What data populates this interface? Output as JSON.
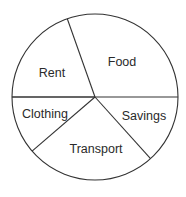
{
  "chart_data": {
    "type": "pie",
    "title": "",
    "categories": [
      "Savings",
      "Transport",
      "Clothing",
      "Rent",
      "Food"
    ],
    "values": [
      13.3,
      25.3,
      11.4,
      19.6,
      30.4
    ],
    "units": "percent (estimated from slice angles; no values printed on chart)",
    "slices": [
      {
        "label": "Savings",
        "start_deg": 0,
        "end_deg": 48,
        "value": 13.3,
        "label_x": 144,
        "label_y": 120
      },
      {
        "label": "Transport",
        "start_deg": 48,
        "end_deg": 139.3,
        "value": 25.3,
        "label_x": 96,
        "label_y": 153
      },
      {
        "label": "Clothing",
        "start_deg": 139.3,
        "end_deg": 180,
        "value": 11.4,
        "label_x": 45,
        "label_y": 118
      },
      {
        "label": "Rent",
        "start_deg": 180,
        "end_deg": 250.5,
        "value": 19.6,
        "label_x": 52,
        "label_y": 77
      },
      {
        "label": "Food",
        "start_deg": 250.5,
        "end_deg": 360,
        "value": 30.4,
        "label_x": 122,
        "label_y": 66
      }
    ],
    "legend": null,
    "fill": "none",
    "stroke_color": "#333333",
    "background_color": "#ffffff"
  },
  "geometry": {
    "cx": 95,
    "cy": 97,
    "r": 83
  }
}
